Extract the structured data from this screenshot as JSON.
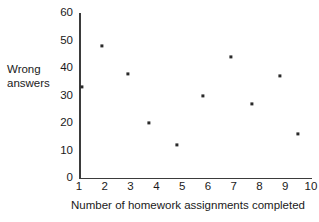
{
  "chart_data": {
    "type": "scatter",
    "title": "",
    "xlabel": "Number of homework assignments completed",
    "ylabel": "Wrong answers",
    "ylabel_line1": "Wrong",
    "ylabel_line2": "answers",
    "xlim": [
      1,
      10
    ],
    "ylim": [
      0,
      60
    ],
    "xticks": [
      1,
      2,
      3,
      4,
      5,
      6,
      7,
      8,
      9,
      10
    ],
    "xtick_labels": [
      "1",
      "2",
      "3",
      "4",
      "5",
      "6",
      "7",
      "8",
      "9",
      "10"
    ],
    "yticks": [
      0,
      10,
      20,
      30,
      40,
      50,
      60
    ],
    "ytick_labels": [
      "0",
      "10",
      "20",
      "30",
      "40",
      "50",
      "60"
    ],
    "grid": false,
    "legend": null,
    "marker_color": "#2a2a2a",
    "axis_color": "#3b3b3b",
    "background": "#ffffff",
    "points": [
      {
        "x": 1.1,
        "y": 33
      },
      {
        "x": 1.9,
        "y": 48
      },
      {
        "x": 2.9,
        "y": 38
      },
      {
        "x": 3.7,
        "y": 20
      },
      {
        "x": 4.8,
        "y": 12
      },
      {
        "x": 5.8,
        "y": 30
      },
      {
        "x": 6.9,
        "y": 44
      },
      {
        "x": 7.7,
        "y": 27
      },
      {
        "x": 8.8,
        "y": 37
      },
      {
        "x": 9.5,
        "y": 16
      }
    ]
  }
}
